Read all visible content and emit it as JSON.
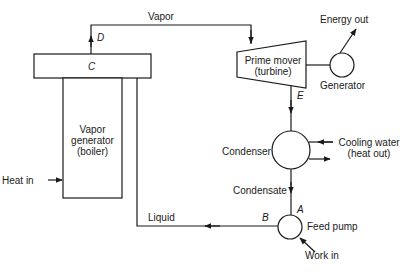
{
  "diagram": {
    "type": "vapor-power-cycle",
    "components": {
      "vapor_generator": {
        "lines": [
          "Vapor",
          "generator",
          "(boiler)"
        ]
      },
      "drum_label": "C",
      "turbine": {
        "lines": [
          "Prime mover",
          "(turbine)"
        ]
      },
      "generator": "Generator",
      "condenser": "Condenser",
      "feed_pump": "Feed pump"
    },
    "streams": {
      "vapor": "Vapor",
      "liquid": "Liquid",
      "condensate": "Condensate",
      "heat_in": "Heat in",
      "energy_out": "Energy out",
      "cooling_water": [
        "Cooling water",
        "(heat out)"
      ],
      "work_in": "Work in"
    },
    "state_points": {
      "A": "A",
      "B": "B",
      "C": "C",
      "D": "D",
      "E": "E"
    },
    "colors": {
      "stroke": "#1a1a1a",
      "background": "#ffffff"
    }
  }
}
